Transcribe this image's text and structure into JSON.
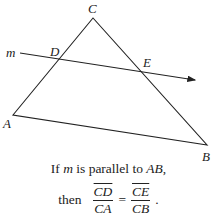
{
  "diagram": {
    "points": {
      "C": {
        "label": "C",
        "x": 93,
        "y": 18
      },
      "A": {
        "label": "A",
        "x": 13,
        "y": 115
      },
      "B": {
        "label": "B",
        "x": 207,
        "y": 145
      },
      "D": {
        "label": "D",
        "x": 58,
        "y": 60
      },
      "E": {
        "label": "E",
        "x": 143,
        "y": 72
      }
    },
    "line_label": "m"
  },
  "caption": {
    "line1_prefix": "If ",
    "line1_var": "m",
    "line1_mid": " is parallel to ",
    "line1_seg": "AB",
    "line1_end": ",",
    "then": "then",
    "frac1_num": "CD",
    "frac1_den": "CA",
    "equals": "=",
    "frac2_num": "CE",
    "frac2_den": "CB",
    "end": "."
  }
}
